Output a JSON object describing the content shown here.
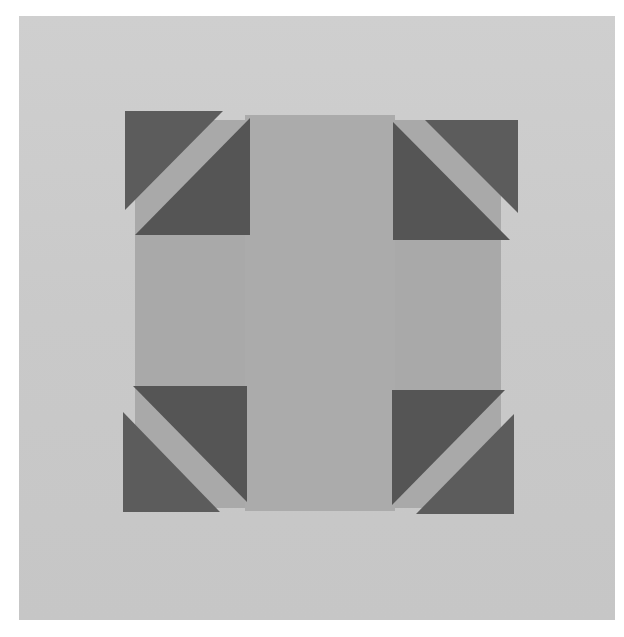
{
  "image": {
    "subject": "Quilt block: light gray cross center with four dark gray half-square-triangle corner units",
    "colors": {
      "page": "#ffffff",
      "background": "#c9c9c9",
      "center_fabric": "#a7a7a7",
      "dark_fabric": "#5a5a5a",
      "gap": "#cfcfcf"
    }
  }
}
